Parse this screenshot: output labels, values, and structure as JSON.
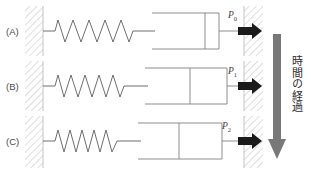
{
  "figure": {
    "type": "mechanical-model-diagram",
    "background_color": "#ffffff",
    "line_color": "#8d8d8d",
    "arrow_color": "#1a1a1a",
    "time_arrow_color": "#787878",
    "wall_hatch_color": "#c9c9c9"
  },
  "time_axis": {
    "label": "時間の経過",
    "direction": "downward",
    "characters": [
      "時",
      "間",
      "の",
      "経",
      "過"
    ]
  },
  "rows": [
    {
      "label": "(A)",
      "force_label": "P",
      "force_subscript": "0",
      "force_full": "P0",
      "spring_state": "extended",
      "spring_coils": 6,
      "spring_end_x": 133,
      "piston_position": "right",
      "piston_x": 205,
      "cylinder_left_x": 155,
      "cylinder_right_x": 219,
      "arrow_tip_x": 262,
      "arrow_tail_x": 240
    },
    {
      "label": "(B)",
      "force_label": "P",
      "force_subscript": "1",
      "force_full": "P1",
      "spring_state": "partially relaxed",
      "spring_coils": 6,
      "spring_end_x": 127,
      "piston_position": "middle",
      "piston_x": 190,
      "cylinder_left_x": 148,
      "cylinder_right_x": 227,
      "arrow_tip_x": 262,
      "arrow_tail_x": 240
    },
    {
      "label": "(C)",
      "force_label": "P",
      "force_subscript": "2",
      "force_full": "P2",
      "spring_state": "relaxed",
      "spring_coils": 6,
      "spring_end_x": 121,
      "piston_position": "left",
      "piston_x": 179,
      "cylinder_left_x": 141,
      "cylinder_right_x": 222,
      "arrow_tip_x": 262,
      "arrow_tail_x": 240
    }
  ],
  "walls": {
    "left": {
      "x": 25,
      "width": 18,
      "hatch": "diagonal"
    },
    "right": {
      "x": 244,
      "width": 19,
      "hatch": "diagonal"
    }
  }
}
